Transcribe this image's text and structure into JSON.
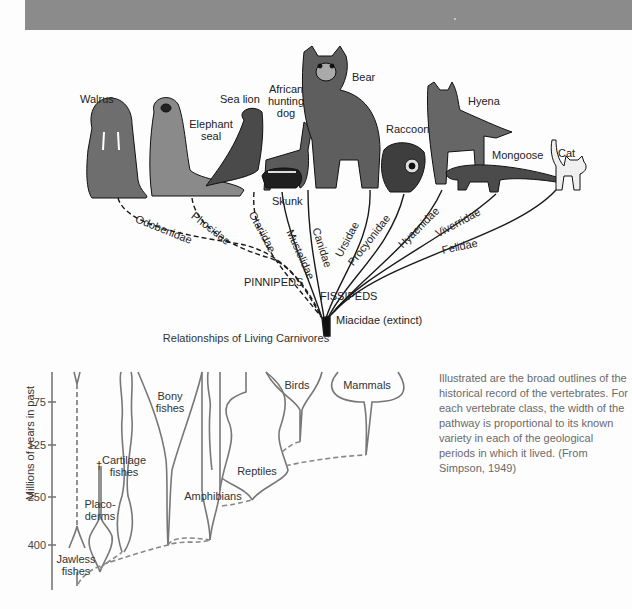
{
  "header_band": {
    "color": "#8b8b8b"
  },
  "carnivores": {
    "caption": "Relationships of Living Carnivores",
    "animals": [
      {
        "name": "Walrus"
      },
      {
        "name": "Elephant seal"
      },
      {
        "name": "Sea lion"
      },
      {
        "name": "African hunting dog"
      },
      {
        "name": "Bear"
      },
      {
        "name": "Skunk"
      },
      {
        "name": "Raccoon"
      },
      {
        "name": "Hyena"
      },
      {
        "name": "Mongoose"
      },
      {
        "name": "Cat"
      }
    ],
    "labels": {
      "walrus": "Walrus",
      "elephant_seal_1": "Elephant",
      "elephant_seal_2": "seal",
      "sea_lion": "Sea lion",
      "dog_1": "African",
      "dog_2": "hunting",
      "dog_3": "dog",
      "bear": "Bear",
      "skunk": "Skunk",
      "raccoon": "Raccoon",
      "hyena": "Hyena",
      "mongoose": "Mongoose",
      "cat": "Cat"
    },
    "families": {
      "odobenidae": "Odobenidae",
      "phocidae": "Phocidae",
      "otariidae": "Otariidae",
      "mustelidae": "Mustelidae",
      "canidae": "Canidae",
      "ursidae": "Ursidae",
      "procyonidae": "Procyonidae",
      "hyaenidae": "Hyaenidae",
      "viverridae": "Viverridae",
      "felidae": "Felidae"
    },
    "groups": {
      "pinnipeds": "PINNIPEDS",
      "fissipeds": "FISSIPEDS",
      "root": "Miacidae (extinct)"
    }
  },
  "vertebrates": {
    "y_axis_label": "Millions of years in past",
    "y_ticks": [
      "75",
      "125",
      "250",
      "400"
    ],
    "classes": {
      "jawless_1": "Jawless",
      "jawless_2": "fishes",
      "placoderms_1": "Placo-",
      "placoderms_2": "derms",
      "extinct_mark": "†",
      "cartilage_1": "Cartilage",
      "cartilage_2": "fishes",
      "bony_1": "Bony",
      "bony_2": "fishes",
      "amphibians": "Amphibians",
      "reptiles": "Reptiles",
      "birds": "Birds",
      "mammals": "Mammals"
    },
    "description": "Illustrated are the broad outlines of the historical record of the vertebrates. For each vertebrate class, the width of the pathway is proportional to its known variety in each of the geological periods in which it lived. (From Simpson, 1949)"
  }
}
